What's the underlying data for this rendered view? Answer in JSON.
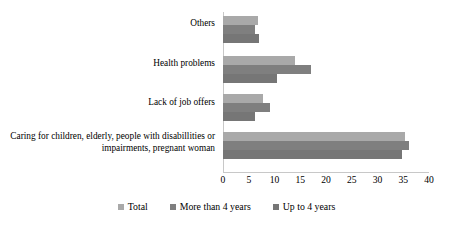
{
  "chart_data": {
    "type": "bar",
    "orientation": "horizontal",
    "title": "",
    "subtitle": "",
    "xlabel": "",
    "ylabel": "",
    "xlim": [
      0,
      40
    ],
    "xticks": [
      0,
      5,
      10,
      15,
      20,
      25,
      30,
      35,
      40
    ],
    "grid": false,
    "legend_position": "bottom",
    "categories": [
      "Caring for children, elderly, people with disabillities or impairments, pregnant woman",
      "Lack of job offers",
      "Health problems",
      "Others"
    ],
    "series": [
      {
        "name": "Total",
        "color": "#a9a9a9",
        "values": [
          35.3,
          7.7,
          14.0,
          6.8
        ]
      },
      {
        "name": "More than 4 years",
        "color": "#7f7f7f",
        "values": [
          36.1,
          9.2,
          17.0,
          6.3
        ]
      },
      {
        "name": "Up to 4 years",
        "color": "#767676",
        "values": [
          34.7,
          6.3,
          10.5,
          7.0
        ]
      }
    ]
  },
  "axis": {
    "tick_labels": [
      "0",
      "5",
      "10",
      "15",
      "20",
      "25",
      "30",
      "35",
      "40"
    ]
  },
  "category_labels": [
    "Others",
    "Health problems",
    "Lack of job offers",
    "Caring for children, elderly, people with disabillities or impairments, pregnant woman"
  ],
  "legend": {
    "items": [
      {
        "label": "Total",
        "color": "#a9a9a9"
      },
      {
        "label": "More than 4 years",
        "color": "#7f7f7f"
      },
      {
        "label": "Up to 4 years",
        "color": "#767676"
      }
    ]
  },
  "colors": {
    "total": "#a9a9a9",
    "more_than_4_years": "#7f7f7f",
    "up_to_4_years": "#767676",
    "axis": "#c8c8c8",
    "background": "#ffffff",
    "text": "#000000"
  }
}
